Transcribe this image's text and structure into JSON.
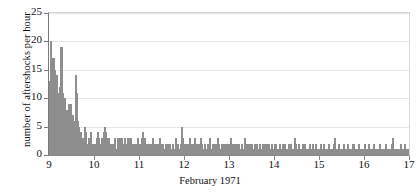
{
  "chart_data": {
    "type": "bar",
    "title": "",
    "subtitle": "",
    "xlabel": "February 1971",
    "ylabel": "number of aftershocks per hour",
    "xlim": [
      9,
      17
    ],
    "ylim": [
      0,
      25
    ],
    "yticks": [
      0,
      5,
      10,
      15,
      20,
      25
    ],
    "xticks": [
      9,
      10,
      11,
      12,
      13,
      14,
      15,
      16,
      17
    ],
    "xtick_labels": [
      "9",
      "10",
      "11",
      "12",
      "13",
      "14",
      "15",
      "16",
      "17"
    ],
    "ytick_labels": [
      "0",
      "5",
      "10",
      "15",
      "20",
      "25"
    ],
    "grid": true,
    "legend": false,
    "bin_width_days": 0.0416666667,
    "bin_unit": "hour",
    "series_name": "aftershocks per hour",
    "bar_color": "#cfcfcf",
    "bar_edge_color": "#8e8e8e",
    "grid_color": "#e6e6e6",
    "axis_color": "#7a7a7a",
    "values": [
      13,
      20,
      18,
      17,
      16,
      17,
      17,
      15,
      13,
      14,
      12,
      11,
      10,
      8,
      12,
      19,
      19,
      19,
      11,
      10,
      10,
      9,
      8,
      7,
      6,
      8,
      9,
      7,
      6,
      9,
      7,
      7,
      6,
      6,
      5,
      6,
      14,
      11,
      6,
      5,
      5,
      4,
      3,
      4,
      2,
      3,
      2,
      1,
      5,
      4,
      3,
      2,
      2,
      1,
      3,
      2,
      4,
      3,
      2,
      1,
      2,
      2,
      1,
      2,
      2,
      3,
      4,
      3,
      2,
      1,
      2,
      3,
      2,
      3,
      4,
      2,
      5,
      4,
      3,
      2,
      1,
      3,
      2,
      2,
      1,
      1,
      2,
      1,
      2,
      3,
      1,
      0,
      1,
      2,
      3,
      2,
      1,
      3,
      2,
      3,
      2,
      1,
      2,
      1,
      3,
      2,
      1,
      2,
      3,
      2,
      3,
      3,
      2,
      1,
      1,
      2,
      1,
      2,
      1,
      1,
      2,
      3,
      2,
      1,
      2,
      2,
      1,
      3,
      4,
      3,
      2,
      3,
      2,
      2,
      1,
      1,
      2,
      1,
      1,
      2,
      2,
      2,
      3,
      1,
      2,
      1,
      1,
      1,
      2,
      1,
      2,
      3,
      1,
      2,
      2,
      1,
      2,
      1,
      1,
      1,
      2,
      1,
      2,
      1,
      1,
      2,
      1,
      1,
      1,
      2,
      2,
      1,
      1,
      2,
      3,
      1,
      2,
      2,
      1,
      1,
      2,
      1,
      5,
      3,
      2,
      1,
      1,
      2,
      1,
      1,
      2,
      1,
      2,
      3,
      2,
      2,
      1,
      1,
      2,
      2,
      3,
      1,
      2,
      1,
      1,
      2,
      1,
      2,
      3,
      1,
      2,
      1,
      1,
      1,
      2,
      1,
      1,
      2,
      1,
      2,
      3,
      2,
      1,
      1,
      2,
      1,
      2,
      1,
      1,
      2,
      2,
      1,
      3,
      2,
      1,
      1,
      1,
      2,
      1,
      1,
      2,
      1,
      2,
      1,
      2,
      1,
      1,
      2,
      1,
      3,
      2,
      1,
      2,
      1,
      1,
      2,
      1,
      2,
      1,
      1,
      1,
      2,
      1,
      1,
      1,
      2,
      1,
      1,
      2,
      3,
      2,
      1,
      1,
      2,
      1,
      1,
      2,
      1,
      2,
      1,
      1,
      1,
      2,
      1,
      1,
      2,
      1,
      1,
      1,
      2,
      2,
      1,
      1,
      1,
      2,
      1,
      2,
      1,
      1,
      2,
      1,
      1,
      2,
      1,
      1,
      1,
      2,
      1,
      1,
      1,
      2,
      1,
      2,
      1,
      1,
      1,
      1,
      2,
      1,
      1,
      1,
      2,
      1,
      1,
      2,
      1,
      1,
      1,
      1,
      2,
      1,
      1,
      2,
      1,
      1,
      1,
      1,
      2,
      3,
      2,
      1,
      1,
      1,
      2,
      1,
      1,
      1,
      1,
      2,
      1,
      1,
      1,
      2,
      1,
      1,
      1,
      1,
      1,
      2,
      1,
      1,
      1,
      2,
      1,
      1,
      1,
      1,
      2,
      1,
      1,
      1,
      1,
      1,
      2,
      1,
      1,
      1,
      1,
      2,
      1,
      1,
      1,
      1,
      1,
      2,
      1,
      1,
      1,
      1,
      1,
      1,
      2,
      3,
      2,
      1,
      1,
      1,
      1,
      2,
      1,
      1,
      1,
      1,
      1,
      1,
      2,
      1,
      1,
      1,
      1,
      1,
      2,
      1,
      1,
      1,
      1,
      1,
      1,
      2,
      2,
      1,
      1,
      1,
      1,
      1,
      1,
      2,
      1,
      1,
      1,
      1,
      1,
      1,
      1,
      2,
      1,
      1,
      1,
      1,
      2,
      1,
      1,
      1,
      1,
      1,
      1,
      1,
      2,
      1,
      1,
      1,
      1,
      1,
      1,
      2,
      1,
      1,
      1,
      1,
      1,
      1,
      1,
      1,
      2,
      1,
      1,
      1,
      1,
      1,
      1,
      1,
      2,
      3,
      2,
      1,
      1,
      1,
      1,
      1,
      1,
      1,
      1,
      1,
      2,
      1,
      1,
      1,
      1,
      1,
      2,
      1,
      1,
      1,
      1,
      1,
      1
    ]
  }
}
